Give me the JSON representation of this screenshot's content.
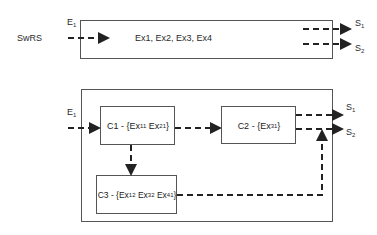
{
  "top_diagram": {
    "system_label": "SwRS",
    "input": {
      "name": "E",
      "sub": "1"
    },
    "content": "Ex1,  Ex2,  Ex3,  Ex4",
    "outputs": [
      {
        "name": "S",
        "sub": "1"
      },
      {
        "name": "S",
        "sub": "2"
      }
    ]
  },
  "bottom_diagram": {
    "input": {
      "name": "E",
      "sub": "1"
    },
    "components": [
      {
        "id": "C1",
        "prefix": "C1 - {",
        "items": [
          {
            "name": "Ex",
            "sub": "11"
          },
          {
            "name": "Ex",
            "sub": "21"
          }
        ],
        "suffix": "}"
      },
      {
        "id": "C2",
        "prefix": "C2 - {",
        "items": [
          {
            "name": "Ex",
            "sub": "31"
          }
        ],
        "suffix": "}"
      },
      {
        "id": "C3",
        "prefix": "C3 - {",
        "items": [
          {
            "name": "Ex",
            "sub": "12"
          },
          {
            "name": "Ex",
            "sub": "32"
          },
          {
            "name": "Ex",
            "sub": "41"
          }
        ],
        "suffix": "}"
      }
    ],
    "outputs": [
      {
        "name": "S",
        "sub": "1"
      },
      {
        "name": "S",
        "sub": "2"
      }
    ]
  },
  "colors": {
    "line": "#2a2a2a",
    "box": "#555555"
  }
}
